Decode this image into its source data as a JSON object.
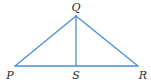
{
  "diagram": {
    "type": "triangle-with-altitude",
    "line_color": "#4a8fd6",
    "label_color": "#2a2a2a",
    "points": {
      "P": {
        "x": 15,
        "y": 66,
        "label": "P",
        "lx": 10,
        "ly": 79
      },
      "Q": {
        "x": 76,
        "y": 16,
        "label": "Q",
        "lx": 76,
        "ly": 11
      },
      "R": {
        "x": 138,
        "y": 66,
        "label": "R",
        "lx": 143,
        "ly": 79
      },
      "S": {
        "x": 76,
        "y": 66,
        "label": "S",
        "lx": 76,
        "ly": 79
      }
    },
    "segments": [
      {
        "from": "P",
        "to": "Q"
      },
      {
        "from": "Q",
        "to": "R"
      },
      {
        "from": "P",
        "to": "R"
      },
      {
        "from": "Q",
        "to": "S"
      }
    ]
  }
}
